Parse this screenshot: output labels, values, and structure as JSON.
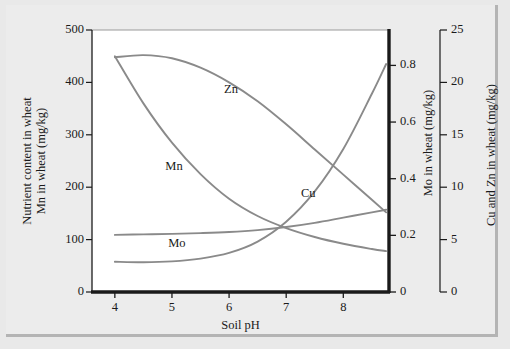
{
  "figure": {
    "background_color": "#ececec",
    "plot_background_color": "#ffffff",
    "curve_color": "#8a8a8a",
    "axis_color": "#1a1a1a"
  },
  "chart_data": {
    "type": "line",
    "title": "",
    "subtitle": "",
    "xlabel": "Soil pH",
    "xlim": [
      3.6,
      8.8
    ],
    "xticks": [
      4,
      5,
      6,
      7,
      8
    ],
    "xtick_labels": [
      "4",
      "5",
      "6",
      "7",
      "8"
    ],
    "grid": false,
    "legend_position": "inline-curve-labels",
    "axes": [
      {
        "id": "left",
        "label_line1": "Nutrient content in wheat",
        "label_line2": "Mn in wheat (mg/kg)",
        "ylim": [
          0,
          500
        ],
        "yticks": [
          0,
          100,
          200,
          300,
          400,
          500
        ],
        "ytick_labels": [
          "0",
          "100",
          "200",
          "300",
          "400",
          "500"
        ],
        "units": "mg/kg",
        "series_names": [
          "Mn"
        ]
      },
      {
        "id": "right-mo",
        "label": "Mo in wheat (mg/kg)",
        "ylim": [
          0,
          0.925
        ],
        "yticks": [
          0,
          0.2,
          0.4,
          0.6,
          0.8
        ],
        "ytick_labels": [
          "0",
          "0.2",
          "0.4",
          "0.6",
          "0.8"
        ],
        "units": "mg/kg",
        "series_names": [
          "Mo"
        ]
      },
      {
        "id": "right-cuzn",
        "label": "Cu and Zn in wheat (mg/kg)",
        "ylim": [
          0,
          25
        ],
        "yticks": [
          0,
          5,
          10,
          15,
          20,
          25
        ],
        "ytick_labels": [
          "0",
          "5",
          "10",
          "15",
          "20",
          "25"
        ],
        "units": "mg/kg",
        "series_names": [
          "Cu",
          "Zn"
        ]
      }
    ],
    "series": [
      {
        "name": "Zn",
        "axis": "right-cuzn",
        "label": "Zn",
        "label_at": {
          "x": 6.0,
          "y": 19.2
        },
        "x": [
          4.0,
          4.5,
          5.0,
          5.5,
          6.0,
          6.5,
          7.0,
          7.5,
          8.0,
          8.5,
          8.75
        ],
        "y": [
          22.4,
          22.6,
          22.3,
          21.4,
          20.0,
          18.2,
          16.0,
          13.6,
          11.2,
          8.8,
          7.6
        ]
      },
      {
        "name": "Mn",
        "axis": "left",
        "label": "Mn",
        "label_at": {
          "x": 5.0,
          "y": 237
        },
        "x": [
          4.0,
          4.5,
          5.0,
          5.5,
          6.0,
          6.5,
          7.0,
          7.5,
          8.0,
          8.5,
          8.75
        ],
        "y": [
          450,
          360,
          285,
          225,
          178,
          145,
          122,
          105,
          92,
          82,
          78
        ]
      },
      {
        "name": "Mo",
        "axis": "right-mo",
        "label": "Mo",
        "label_at": {
          "x": 5.05,
          "y": 0.165
        },
        "x": [
          4.0,
          4.5,
          5.0,
          5.5,
          6.0,
          6.5,
          7.0,
          7.5,
          8.0,
          8.5,
          8.75
        ],
        "y": [
          0.107,
          0.105,
          0.108,
          0.118,
          0.138,
          0.178,
          0.248,
          0.355,
          0.505,
          0.7,
          0.805
        ]
      },
      {
        "name": "Cu",
        "axis": "right-cuzn",
        "label": "Cu",
        "label_at": {
          "x": 7.35,
          "y": 9.3
        },
        "x": [
          4.0,
          4.5,
          5.0,
          5.5,
          6.0,
          6.5,
          7.0,
          7.5,
          8.0,
          8.5,
          8.75
        ],
        "y": [
          5.45,
          5.5,
          5.55,
          5.62,
          5.72,
          5.9,
          6.2,
          6.6,
          7.1,
          7.6,
          7.85
        ]
      }
    ]
  }
}
